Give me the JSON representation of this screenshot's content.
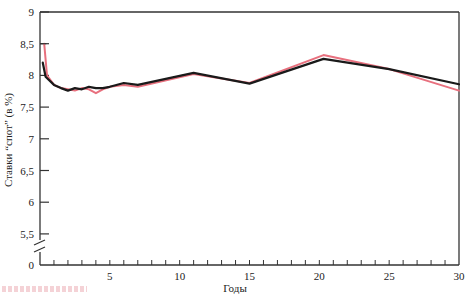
{
  "chart_data": {
    "type": "line",
    "title": "",
    "xlabel": "Годы",
    "ylabel": "Ставки “спот” (в %)",
    "xlim": [
      0,
      30
    ],
    "ylim": [
      5.5,
      9
    ],
    "y_axis_break": true,
    "y_break_baseline_label": "0",
    "grid": false,
    "legend": null,
    "x_ticks": [
      0,
      5,
      10,
      15,
      20,
      25,
      30
    ],
    "x_tick_labels": [
      "",
      "5",
      "10",
      "15",
      "20",
      "25",
      "30"
    ],
    "x_minor_tick_step": 1,
    "y_ticks": [
      5.5,
      6,
      6.5,
      7,
      7.5,
      8,
      8.5,
      9
    ],
    "y_tick_labels": [
      "5,5",
      "6",
      "6,5",
      "7",
      "7,5",
      "8",
      "8,5",
      "9"
    ],
    "series": [
      {
        "name": "Pink series (observed spot rates)",
        "color": "#e8707e",
        "x": [
          0.3,
          0.5,
          1,
          1.5,
          2,
          2.5,
          3,
          3.5,
          4,
          4.5,
          5,
          6,
          7,
          11,
          15,
          20.3,
          25,
          30
        ],
        "y": [
          8.5,
          8.0,
          7.85,
          7.8,
          7.78,
          7.76,
          7.8,
          7.78,
          7.72,
          7.78,
          7.82,
          7.85,
          7.82,
          8.02,
          7.88,
          8.32,
          8.1,
          7.76
        ]
      },
      {
        "name": "Black series (fitted spot rates)",
        "color": "#1a1a1a",
        "x": [
          0.2,
          0.4,
          1,
          1.5,
          2,
          2.5,
          3,
          3.5,
          4,
          4.5,
          5,
          6,
          7,
          11,
          15,
          20.3,
          25,
          30
        ],
        "y": [
          8.2,
          7.98,
          7.85,
          7.8,
          7.76,
          7.8,
          7.78,
          7.82,
          7.8,
          7.8,
          7.82,
          7.88,
          7.85,
          8.04,
          7.87,
          8.26,
          8.1,
          7.86
        ]
      }
    ]
  },
  "labels": {
    "x_axis_title": "Годы",
    "y_axis_title": "Ставки “спот” (в %)",
    "zero": "0"
  }
}
